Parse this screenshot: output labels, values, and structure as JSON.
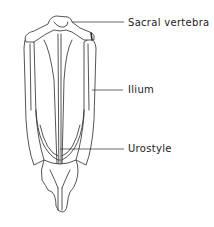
{
  "figure": {
    "labels": [
      {
        "id": "sacral-vertebra",
        "text": "Sacral vertebra",
        "x": 128,
        "y": 17
      },
      {
        "id": "ilium",
        "text": "Ilium",
        "x": 128,
        "y": 84
      },
      {
        "id": "urostyle",
        "text": "Urostyle",
        "x": 128,
        "y": 143
      }
    ],
    "colors": {
      "line": "#2a2a2a",
      "background": "#ffffff",
      "text": "#222222"
    }
  }
}
